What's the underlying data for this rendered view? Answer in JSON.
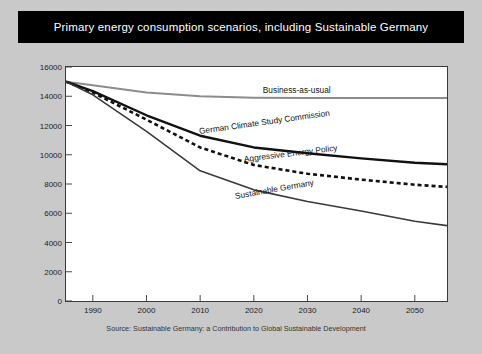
{
  "slide": {
    "title": "Primary energy consumption scenarios, including Sustainable Germany",
    "source": "Source: Sustainable Germany: a Contribution to Global Sustainable Development",
    "title_bg": "#000000",
    "title_color": "#ffffff",
    "background": "#c9c9c9",
    "plot_background": "#ffffff"
  },
  "chart_data": {
    "type": "line",
    "title": "Primary energy consumption scenarios, including Sustainable Germany",
    "xlabel": "",
    "ylabel": "",
    "xlim": [
      1985,
      2056
    ],
    "ylim": [
      0,
      16000
    ],
    "xticks": [
      1990,
      2000,
      2010,
      2020,
      2030,
      2040,
      2050
    ],
    "xtick_labels": [
      "1990",
      "2000",
      "2010",
      "2020",
      "2030",
      "2040",
      "2050"
    ],
    "yticks": [
      0,
      2000,
      4000,
      6000,
      8000,
      10000,
      12000,
      14000,
      16000
    ],
    "ytick_labels": [
      "0",
      "2000",
      "4000",
      "6000",
      "8000",
      "10000",
      "12000",
      "14000",
      "16000"
    ],
    "grid": false,
    "legend": "inline-labels",
    "series": [
      {
        "name": "Business-as-usual",
        "color": "#8c8c8c",
        "style": "solid",
        "width": 2.0,
        "label_color": "#111111",
        "x": [
          1985,
          1990,
          2000,
          2010,
          2020,
          2030,
          2040,
          2050,
          2056
        ],
        "values": [
          15000,
          14750,
          14250,
          14000,
          13900,
          13880,
          13880,
          13880,
          13880
        ]
      },
      {
        "name": "German Climate Study Commission",
        "color": "#111111",
        "style": "solid",
        "width": 2.4,
        "label_color": "#111111",
        "x": [
          1985,
          1990,
          2000,
          2010,
          2020,
          2030,
          2040,
          2050,
          2056
        ],
        "values": [
          15000,
          14350,
          12700,
          11300,
          10500,
          10100,
          9750,
          9450,
          9350
        ]
      },
      {
        "name": "Aggressive Energy Policy",
        "color": "#111111",
        "style": "dashed",
        "width": 2.6,
        "label_color": "#111111",
        "x": [
          1985,
          1990,
          2000,
          2010,
          2020,
          2030,
          2040,
          2050,
          2056
        ],
        "values": [
          15000,
          14250,
          12400,
          10500,
          9300,
          8700,
          8300,
          7950,
          7800
        ]
      },
      {
        "name": "Sustainable Germany",
        "color": "#3a3a3a",
        "style": "solid",
        "width": 1.6,
        "label_color": "#111111",
        "x": [
          1985,
          1990,
          2000,
          2010,
          2020,
          2030,
          2040,
          2050,
          2056
        ],
        "values": [
          15000,
          14100,
          11600,
          8900,
          7600,
          6800,
          6150,
          5450,
          5150
        ]
      }
    ],
    "annotations": [
      {
        "text": "Business-as-usual",
        "x": 2028,
        "y": 14450,
        "rotation": 0
      },
      {
        "text": "German Climate Study Commission",
        "x": 2022,
        "y": 11600,
        "rotation": -8
      },
      {
        "text": "Aggressive Energy Policy",
        "x": 2027,
        "y": 9700,
        "rotation": -7
      },
      {
        "text": "Sustainable Germany",
        "x": 2024,
        "y": 7150,
        "rotation": -10
      }
    ]
  }
}
